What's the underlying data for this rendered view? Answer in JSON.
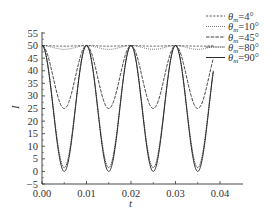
{
  "chart_data": {
    "type": "line",
    "title": "",
    "xlabel": "t",
    "ylabel": "I",
    "xlim": [
      0.0,
      0.044
    ],
    "ylim": [
      -5,
      55
    ],
    "xticks": [
      0.0,
      0.01,
      0.02,
      0.03,
      0.04
    ],
    "xtick_labels": [
      "0.00",
      "0.01",
      "0.02",
      "0.03",
      "0.04"
    ],
    "xminor_ticks": [
      0.005,
      0.015,
      0.025,
      0.035
    ],
    "yticks": [
      -5,
      0,
      5,
      10,
      15,
      20,
      25,
      30,
      35,
      40,
      45,
      50,
      55
    ],
    "ytick_labels": [
      "-5",
      "0",
      "5",
      "10",
      "15",
      "20",
      "25",
      "30",
      "35",
      "40",
      "45",
      "50",
      "55"
    ],
    "grid": false,
    "legend_position": "upper right (outside plot top)",
    "model": "I = 50 * (cos^2(theta) + sin^2(theta) * cos^2(pi * t / 0.01))",
    "t_range": [
      0.0,
      0.0385
    ],
    "period": 0.01,
    "series": [
      {
        "name": "θm=4°",
        "theta_deg": 4,
        "style": "dashed",
        "max": 50,
        "min": 49.76
      },
      {
        "name": "θm=10°",
        "theta_deg": 10,
        "style": "dotted",
        "max": 50,
        "min": 48.49
      },
      {
        "name": "θm=45°",
        "theta_deg": 45,
        "style": "longdash",
        "max": 50,
        "min": 25.0
      },
      {
        "name": "θm=80°",
        "theta_deg": 80,
        "style": "densedash",
        "max": 50,
        "min": 1.51
      },
      {
        "name": "θm=90°",
        "theta_deg": 90,
        "style": "solid",
        "max": 50,
        "min": 0.0
      }
    ],
    "sample_points": {
      "t": [
        0.0,
        0.0025,
        0.005,
        0.0075,
        0.01,
        0.015,
        0.02,
        0.025,
        0.03,
        0.035,
        0.0385
      ],
      "θm=4°": [
        50,
        49.88,
        49.76,
        49.88,
        50,
        49.76,
        50,
        49.76,
        50,
        49.76,
        49.97
      ],
      "θm=10°": [
        50,
        49.25,
        48.49,
        49.25,
        50,
        48.49,
        50,
        48.49,
        50,
        48.49,
        49.83
      ],
      "θm=45°": [
        50,
        37.5,
        25.0,
        37.5,
        50,
        25.0,
        50,
        25.0,
        50,
        25.0,
        44.4
      ],
      "θm=80°": [
        50,
        25.76,
        1.51,
        25.76,
        50,
        1.51,
        50,
        1.51,
        50,
        1.51,
        39.3
      ],
      "θm=90°": [
        50,
        25.0,
        0.0,
        25.0,
        50,
        0.0,
        50,
        0.0,
        50,
        0.0,
        38.9
      ]
    }
  },
  "legend": {
    "entries": [
      {
        "symbol": "θ",
        "sub": "m",
        "value": "=4°"
      },
      {
        "symbol": "θ",
        "sub": "m",
        "value": "=10°"
      },
      {
        "symbol": "θ",
        "sub": "m",
        "value": "=45°"
      },
      {
        "symbol": "θ",
        "sub": "m",
        "value": "=80°"
      },
      {
        "symbol": "θ",
        "sub": "m",
        "value": "=90°"
      }
    ]
  },
  "colors": {
    "line": "#2a2a2a",
    "axis": "#333333",
    "background": "#ffffff"
  }
}
